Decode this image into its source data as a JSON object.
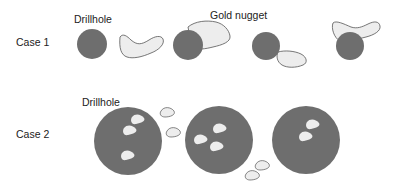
{
  "labels": {
    "case1": "Case 1",
    "case2": "Case 2",
    "drillhole_top": "Drillhole",
    "gold_nugget": "Gold nugget",
    "drillhole_bottom": "Drillhole"
  },
  "colors": {
    "drillhole_fill": "#6e6e6e",
    "nugget_fill": "#ededed",
    "nugget_stroke": "#555555",
    "text": "#222222",
    "background": "#ffffff"
  }
}
